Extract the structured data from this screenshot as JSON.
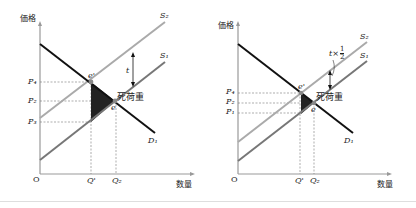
{
  "panels": [
    {
      "id": "left",
      "y_axis_label": "価格",
      "x_axis_label": "数量",
      "origin_label": "O",
      "price_labels": [
        "P₄",
        "P₂",
        "P₃"
      ],
      "quantity_labels": [
        "Q'",
        "Q₂"
      ],
      "curve_labels": {
        "s2": "S₂",
        "s1": "S₁",
        "d1": "D₁"
      },
      "point_labels": {
        "e_prime": "e'",
        "e": "e"
      },
      "tax_label": "t",
      "deadweight_label": "死荷重"
    },
    {
      "id": "right",
      "y_axis_label": "価格",
      "x_axis_label": "数量",
      "origin_label": "O",
      "price_labels": [
        "P₄",
        "P₂",
        "P₁"
      ],
      "quantity_labels": [
        "Q'",
        "Q₂"
      ],
      "curve_labels": {
        "s2": "S₂",
        "s1": "S₁",
        "d1": "D₁"
      },
      "point_labels": {
        "e_prime": "e'",
        "e": "e"
      },
      "tax_label_prefix": "t×",
      "tax_label_num": "1",
      "tax_label_den": "2",
      "deadweight_label": "死荷重"
    }
  ],
  "colors": {
    "demand": "#111111",
    "supply_s2": "#aaaaaa",
    "supply_s1": "#777777",
    "axis": "#999999",
    "deadweight": "#222222",
    "guide": "#777777"
  }
}
